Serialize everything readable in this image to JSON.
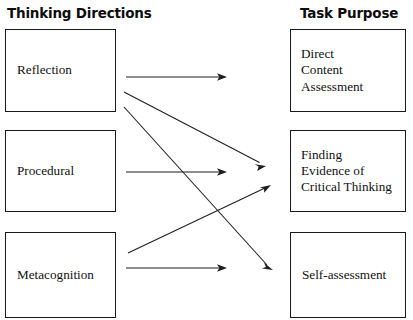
{
  "diagram": {
    "title_left": "Thinking Directions",
    "title_right": "Task Purpose",
    "thinking_directions": [
      {
        "id": "reflection",
        "label": "Reflection"
      },
      {
        "id": "procedural",
        "label": "Procedural"
      },
      {
        "id": "metacognition",
        "label": "Metacognition"
      }
    ],
    "task_purposes": [
      {
        "id": "direct-content-assessment",
        "label": "Direct\nContent\nAssessment"
      },
      {
        "id": "finding-evidence",
        "label": "Finding\nEvidence of\nCritical Thinking"
      },
      {
        "id": "self-assessment",
        "label": "Self-assessment"
      }
    ],
    "connections": [
      {
        "from": "Reflection",
        "to": "Direct Content Assessment"
      },
      {
        "from": "Reflection",
        "to": "Finding Evidence of Critical Thinking"
      },
      {
        "from": "Reflection",
        "to": "Self-assessment"
      },
      {
        "from": "Procedural",
        "to": "Finding Evidence of Critical Thinking"
      },
      {
        "from": "Metacognition",
        "to": "Finding Evidence of Critical Thinking"
      },
      {
        "from": "Metacognition",
        "to": "Self-assessment"
      }
    ],
    "colors": {
      "background": "#ffffff",
      "box_border": "#1a1a1a",
      "text": "#111111",
      "arrow": "#1f1f1f",
      "header_text": "#0d0d0d"
    }
  }
}
